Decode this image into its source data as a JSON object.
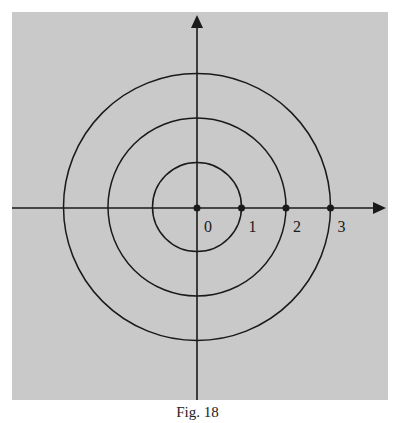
{
  "figure": {
    "caption": "Fig. 18",
    "colors": {
      "background": "#c9c9c9",
      "ink": "#1a1a1a"
    }
  },
  "chart_data": {
    "type": "diagram",
    "circles": [
      {
        "radius": 1
      },
      {
        "radius": 2
      },
      {
        "radius": 3
      }
    ],
    "points": [
      {
        "x": 0,
        "label": "0"
      },
      {
        "x": 1,
        "label": "1"
      },
      {
        "x": 2,
        "label": "2"
      },
      {
        "x": 3,
        "label": "3"
      }
    ],
    "axes": {
      "x_arrow": true,
      "y_arrow": true
    }
  }
}
